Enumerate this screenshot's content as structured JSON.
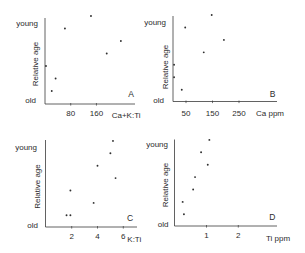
{
  "chart_data": [
    {
      "panel": "A",
      "type": "scatter",
      "title": "",
      "annotation": "A",
      "xlabel": "Ca+K:Ti",
      "ylabel": "Relative age",
      "ytick_labels": {
        "top": "young",
        "bottom": "old"
      },
      "xticks": [
        80,
        160
      ],
      "xlim": [
        0,
        280
      ],
      "ylim": [
        1,
        7
      ],
      "grid": false,
      "legend": null,
      "points": [
        {
          "x": 143,
          "y": 7
        },
        {
          "x": 62,
          "y": 6
        },
        {
          "x": 236,
          "y": 5
        },
        {
          "x": 192,
          "y": 4
        },
        {
          "x": 3,
          "y": 3
        },
        {
          "x": 33,
          "y": 2
        },
        {
          "x": 21,
          "y": 1
        }
      ]
    },
    {
      "panel": "B",
      "type": "scatter",
      "title": "",
      "annotation": "B",
      "xlabel": "Ca ppm",
      "ylabel": "Relative age",
      "ytick_labels": {
        "top": "young",
        "bottom": "old"
      },
      "xticks": [
        50,
        150,
        250
      ],
      "xlim": [
        0,
        390
      ],
      "ylim": [
        1,
        7
      ],
      "grid": false,
      "legend": null,
      "points": [
        {
          "x": 147,
          "y": 7
        },
        {
          "x": 47,
          "y": 6
        },
        {
          "x": 193,
          "y": 5
        },
        {
          "x": 117,
          "y": 4
        },
        {
          "x": 5,
          "y": 3
        },
        {
          "x": 5,
          "y": 2
        },
        {
          "x": 34,
          "y": 1
        }
      ]
    },
    {
      "panel": "C",
      "type": "scatter",
      "title": "",
      "annotation": "C",
      "xlabel": "K:Ti",
      "ylabel": "Relative age",
      "ytick_labels": {
        "top": "young",
        "bottom": "old"
      },
      "xticks": [
        2,
        4,
        6
      ],
      "xlim": [
        0,
        7
      ],
      "ylim": [
        1,
        7
      ],
      "grid": false,
      "legend": null,
      "points": [
        {
          "x": 5.2,
          "y": 7
        },
        {
          "x": 5.0,
          "y": 6
        },
        {
          "x": 4.0,
          "y": 5
        },
        {
          "x": 5.4,
          "y": 4
        },
        {
          "x": 1.9,
          "y": 3
        },
        {
          "x": 3.7,
          "y": 2
        },
        {
          "x": 1.6,
          "y": 1
        },
        {
          "x": 1.9,
          "y": 1
        }
      ]
    },
    {
      "panel": "D",
      "type": "scatter",
      "title": "",
      "annotation": "D",
      "xlabel": "Ti ppm",
      "ylabel": "Relative age",
      "ytick_labels": {
        "top": "young",
        "bottom": "old"
      },
      "xticks": [
        1,
        2
      ],
      "xlim": [
        0,
        3.2
      ],
      "ylim": [
        1,
        7
      ],
      "grid": false,
      "legend": null,
      "points": [
        {
          "x": 1.09,
          "y": 7
        },
        {
          "x": 0.83,
          "y": 6
        },
        {
          "x": 1.04,
          "y": 5
        },
        {
          "x": 0.64,
          "y": 4
        },
        {
          "x": 0.58,
          "y": 3
        },
        {
          "x": 0.25,
          "y": 2
        },
        {
          "x": 0.29,
          "y": 1
        }
      ]
    }
  ]
}
